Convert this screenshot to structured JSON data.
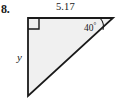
{
  "figure": {
    "problem_number": "8.",
    "type": "right-triangle-diagram",
    "labels": {
      "top_leg": "5.17",
      "left_leg": "y",
      "angle_value": "40",
      "angle_degree_symbol": "°"
    },
    "colors": {
      "background": "#ffffff",
      "fill": "#f0f0f0",
      "stroke": "#1a1a1a",
      "text": "#1a1a1a"
    },
    "geometry": {
      "vertex_top_left": [
        28,
        18
      ],
      "vertex_top_right": [
        113,
        18
      ],
      "vertex_bottom_left": [
        28,
        96
      ],
      "right_angle_marker_size": 11,
      "angle_arc_radius": 13,
      "stroke_width": 1.8
    }
  }
}
